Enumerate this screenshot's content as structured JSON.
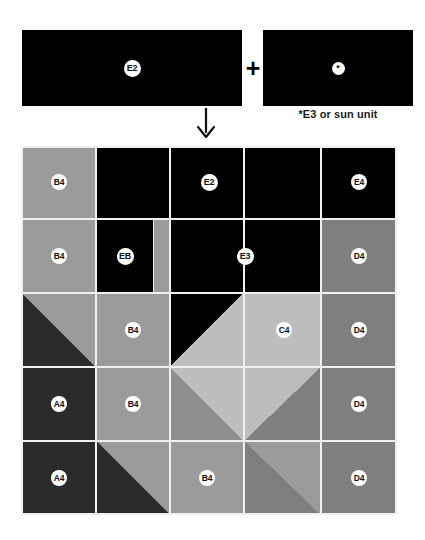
{
  "diagram": {
    "top_units": {
      "left_unit": {
        "label": "E2",
        "name": "e2-unit",
        "color": "#000000"
      },
      "operator": "+",
      "right_unit": {
        "label": "*",
        "name": "e3-sun-unit",
        "color": "#000000"
      },
      "footnote": "*E3 or sun unit",
      "arrow": "down-arrow"
    },
    "colors": {
      "black": "#000000",
      "very_dark_gray": "#2b2b2b",
      "dark_gray": "#7f7f7f",
      "medium_gray": "#9b9b9b",
      "light_gray": "#bdbdbd",
      "sashing": "#f2f0ee",
      "badge_fill": "#ffffff",
      "badge_text": "#111111"
    },
    "grid": {
      "columns": 5,
      "rows": 5,
      "cell_size": 75
    },
    "patch_labels": [
      {
        "id": "r1c1",
        "label": "B4"
      },
      {
        "id": "r1c2-4",
        "label": "E2"
      },
      {
        "id": "r1c5",
        "label": "E4"
      },
      {
        "id": "r2c1",
        "label": "B4"
      },
      {
        "id": "r2c2",
        "label": "EB"
      },
      {
        "id": "r2c3-4",
        "label": "E3"
      },
      {
        "id": "r2c5",
        "label": "D4"
      },
      {
        "id": "r3c2",
        "label": "B4"
      },
      {
        "id": "r3c4",
        "label": "C4"
      },
      {
        "id": "r3c5",
        "label": "D4"
      },
      {
        "id": "r4c1",
        "label": "A4"
      },
      {
        "id": "r4c2",
        "label": "B4"
      },
      {
        "id": "r4c5",
        "label": "D4"
      },
      {
        "id": "r5c1",
        "label": "A4"
      },
      {
        "id": "r5c3",
        "label": "B4"
      },
      {
        "id": "r5c5",
        "label": "D4"
      }
    ]
  }
}
